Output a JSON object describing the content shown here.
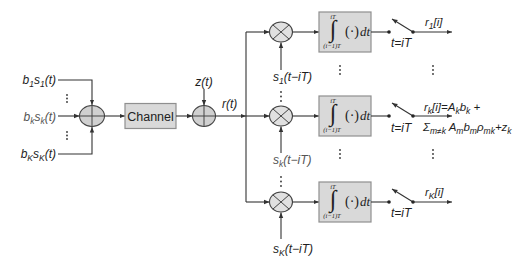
{
  "diagram": {
    "inputs": [
      {
        "b": "b",
        "b_sub": "1",
        "s": "s",
        "s_sub": "1",
        "arg": "(t)"
      },
      {
        "b": "b",
        "b_sub": "k",
        "s": "s",
        "s_sub": "k",
        "arg": "(t)"
      },
      {
        "b": "b",
        "b_sub": "K",
        "s": "s",
        "s_sub": "K",
        "arg": "(t)"
      }
    ],
    "channel": {
      "label": "Channel"
    },
    "noise": {
      "label": "z(t)"
    },
    "received": {
      "label": "r(t)"
    },
    "integrator": {
      "sign": "∫",
      "upper_limit": "iT",
      "lower_limit": "(i−1)T",
      "integrand": "(·)",
      "differential": "dt"
    },
    "branches": [
      {
        "signature": {
          "s": "s",
          "sub": "1",
          "arg": "(t−iT)"
        },
        "sampler": {
          "label": "t=iT"
        },
        "output": {
          "r": "r",
          "sub": "1",
          "rest": "[i]"
        }
      },
      {
        "signature": {
          "s": "s",
          "sub": "k",
          "arg": "(t−iT)"
        },
        "sampler": {
          "label": "t=iT"
        },
        "output": {
          "line1": [
            "r",
            "k",
            "[i]=A",
            "k",
            "b",
            "k",
            " +"
          ],
          "line2": [
            "Σ",
            "m≠k",
            " A",
            "m",
            "b",
            "m",
            "ρ",
            "mk",
            "+z",
            "k"
          ]
        }
      },
      {
        "signature": {
          "s": "s",
          "sub": "K",
          "arg": "(t−iT)"
        },
        "sampler": {
          "label": "t=iT"
        },
        "output": {
          "r": "r",
          "sub": "K",
          "rest": "[i]"
        }
      }
    ],
    "colors": {
      "wire": "#333333",
      "block_fill": "#d9d9d9",
      "block_stroke": "#8f8f8f",
      "adder_fill": "#d0d0d0",
      "multiplier_fill": "#e0e0e0"
    }
  }
}
